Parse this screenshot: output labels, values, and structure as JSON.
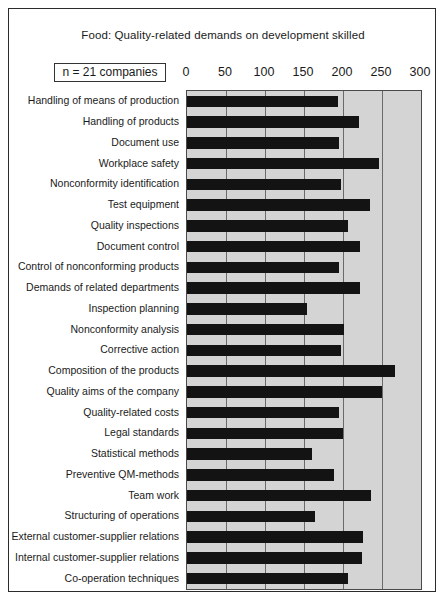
{
  "figure": {
    "title": "Food:  Quality-related demands on development skilled",
    "sample_size_label": "n = 21 companies",
    "border_color": "#2b2b2b",
    "plot_background": "#d4d4d4",
    "bar_color": "#131313",
    "gridline_color": "#6a6a6a"
  },
  "chart_data": {
    "type": "bar",
    "orientation": "horizontal",
    "title": "Food:  Quality-related demands on development skilled",
    "subtitle": "n = 21 companies",
    "xlabel": "",
    "ylabel": "",
    "xlim": [
      0,
      300
    ],
    "xticks": [
      0,
      50,
      100,
      150,
      200,
      250,
      300
    ],
    "xtick_labels": [
      "0",
      "50",
      "100",
      "150",
      "200",
      "250",
      "300"
    ],
    "grid": true,
    "legend": null,
    "categories": [
      "Handling of means of production",
      "Handling of products",
      "Document use",
      "Workplace safety",
      "Nonconformity identification",
      "Test equipment",
      "Quality inspections",
      "Document control",
      "Control of nonconforming products",
      "Demands of related departments",
      "Inspection planning",
      "Nonconformity analysis",
      "Corrective action",
      "Composition of the  products",
      "Quality aims of the company",
      "Quality-related costs",
      "Legal standards",
      "Statistical methods",
      "Preventive QM-methods",
      "Team work",
      "Structuring of operations",
      "External customer-supplier relations",
      "Internal customer-supplier relations",
      "Co-operation techniques"
    ],
    "values": [
      194,
      220,
      195,
      246,
      197,
      235,
      206,
      222,
      195,
      222,
      154,
      201,
      197,
      267,
      250,
      195,
      200,
      160,
      188,
      236,
      164,
      226,
      224,
      206
    ]
  }
}
